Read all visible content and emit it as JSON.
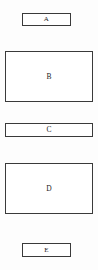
{
  "diagram": {
    "title": "",
    "background_color": "#fdfdfd",
    "box_fill_color": "#ffffff",
    "box_border_color": "#3a3a3a",
    "label_color": "#1c1c1c",
    "canvas": {
      "width": 98,
      "height": 270
    },
    "boxes": [
      {
        "label": "A",
        "x": 22,
        "y": 13,
        "width": 49,
        "height": 13,
        "shape": "rectangle",
        "size": "narrow"
      },
      {
        "label": "B",
        "x": 5,
        "y": 51,
        "width": 88,
        "height": 51,
        "shape": "rectangle",
        "size": "large"
      },
      {
        "label": "C",
        "x": 5,
        "y": 123,
        "width": 88,
        "height": 14,
        "shape": "rectangle",
        "size": "wide"
      },
      {
        "label": "D",
        "x": 5,
        "y": 163,
        "width": 88,
        "height": 51,
        "shape": "rectangle",
        "size": "large"
      },
      {
        "label": "E",
        "x": 22,
        "y": 243,
        "width": 49,
        "height": 14,
        "shape": "rectangle",
        "size": "narrow"
      }
    ]
  }
}
